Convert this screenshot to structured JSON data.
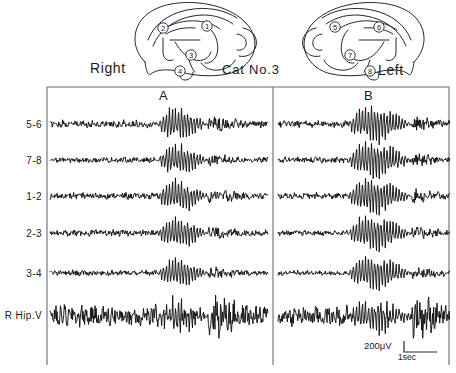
{
  "figure": {
    "title": "Cat No.3",
    "hemisphere_right_label": "Right",
    "hemisphere_left_label": "Left",
    "panel_a_label": "A",
    "panel_b_label": "B"
  },
  "electrodes": {
    "right_hemisphere": [
      "1",
      "2",
      "3",
      "4"
    ],
    "left_hemisphere": [
      "5",
      "6",
      "7",
      "8"
    ]
  },
  "channels": [
    {
      "label": "5-6"
    },
    {
      "label": "7-8"
    },
    {
      "label": "1-2"
    },
    {
      "label": "2-3"
    },
    {
      "label": "3-4"
    },
    {
      "label": "R Hip.V"
    }
  ],
  "scale": {
    "amplitude": "200μV",
    "time": "1sec"
  },
  "chart_data": {
    "type": "line",
    "title": "Cat No.3",
    "xlabel": "",
    "ylabel": "",
    "grid": false,
    "legend_position": "none",
    "panels": [
      {
        "name": "A",
        "hemisphere": "Right",
        "x_range_px": [
          50,
          268
        ],
        "burst_window_px": [
          158,
          208
        ],
        "description": "Right-hemisphere stimulation: short afterdischarge burst centered mid-trace"
      },
      {
        "name": "B",
        "hemisphere": "Left",
        "x_range_px": [
          278,
          450
        ],
        "burst_window_px": [
          348,
          412
        ],
        "description": "Left-hemisphere stimulation: longer, larger-amplitude afterdischarge burst"
      }
    ],
    "series": [
      {
        "name": "5-6",
        "baseline_y_px": 124,
        "panel_a": {
          "baseline_amplitude_uv": 55,
          "burst_peak_amplitude_uv": 430,
          "burst_duration_sec": 1.1
        },
        "panel_b": {
          "baseline_amplitude_uv": 50,
          "burst_peak_amplitude_uv": 470,
          "burst_duration_sec": 1.5
        }
      },
      {
        "name": "7-8",
        "baseline_y_px": 160,
        "panel_a": {
          "baseline_amplitude_uv": 40,
          "burst_peak_amplitude_uv": 400,
          "burst_duration_sec": 1.0
        },
        "panel_b": {
          "baseline_amplitude_uv": 42,
          "burst_peak_amplitude_uv": 500,
          "burst_duration_sec": 1.6
        }
      },
      {
        "name": "1-2",
        "baseline_y_px": 196,
        "panel_a": {
          "baseline_amplitude_uv": 48,
          "burst_peak_amplitude_uv": 420,
          "burst_duration_sec": 1.0
        },
        "panel_b": {
          "baseline_amplitude_uv": 45,
          "burst_peak_amplitude_uv": 480,
          "burst_duration_sec": 1.6
        }
      },
      {
        "name": "2-3",
        "baseline_y_px": 233,
        "panel_a": {
          "baseline_amplitude_uv": 45,
          "burst_peak_amplitude_uv": 410,
          "burst_duration_sec": 1.0
        },
        "panel_b": {
          "baseline_amplitude_uv": 40,
          "burst_peak_amplitude_uv": 470,
          "burst_duration_sec": 1.5
        }
      },
      {
        "name": "3-4",
        "baseline_y_px": 273,
        "panel_a": {
          "baseline_amplitude_uv": 42,
          "burst_peak_amplitude_uv": 360,
          "burst_duration_sec": 0.9
        },
        "panel_b": {
          "baseline_amplitude_uv": 38,
          "burst_peak_amplitude_uv": 460,
          "burst_duration_sec": 1.5
        }
      },
      {
        "name": "R Hip.V",
        "baseline_y_px": 316,
        "panel_a": {
          "baseline_amplitude_uv": 150,
          "burst_peak_amplitude_uv": 380,
          "burst_duration_sec": 0.9
        },
        "panel_b": {
          "baseline_amplitude_uv": 140,
          "burst_peak_amplitude_uv": 400,
          "burst_duration_sec": 1.5
        }
      }
    ]
  }
}
